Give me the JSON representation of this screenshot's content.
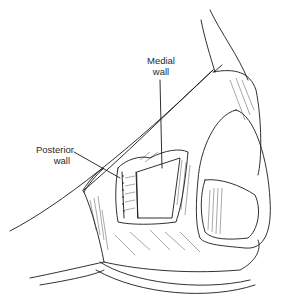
{
  "figure": {
    "type": "anatomical line illustration",
    "labels": {
      "medial_wall": [
        "Medial",
        "wall"
      ],
      "posterior_wall": [
        "Posterior",
        "wall"
      ]
    },
    "colors": {
      "ink": "#1a1a1a",
      "background": "#ffffff",
      "cavity_fill": "#ffffff"
    }
  }
}
